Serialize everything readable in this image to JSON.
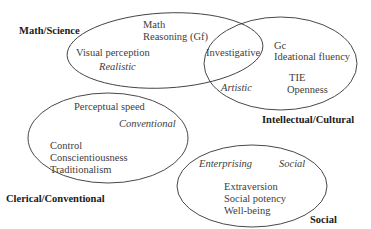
{
  "diagram": {
    "groups": [
      {
        "id": "math-science",
        "label": "Math/Science",
        "ellipse": {
          "cx": 165,
          "cy": 50.5,
          "rx": 98,
          "ry": 37.5
        },
        "items": [
          "Math",
          "Reasoning (Gf)",
          "Visual perception"
        ],
        "interest": "Realistic"
      },
      {
        "id": "intellectual-cultural",
        "label": "Intellectual/Cultural",
        "ellipse": {
          "cx": 280.5,
          "cy": 63.5,
          "rx": 76.5,
          "ry": 46.5
        },
        "items": [
          "Gc",
          "Ideational fluency",
          "TIE",
          "Openness"
        ],
        "interest": "Artistic"
      },
      {
        "id": "clerical-conventional",
        "label": "Clerical/Conventional",
        "ellipse": {
          "cx": 108,
          "cy": 138,
          "rx": 80,
          "ry": 45
        },
        "items": [
          "Perceptual speed",
          "Control",
          "Conscientiousness",
          "Traditionalism"
        ],
        "interest": "Conventional"
      },
      {
        "id": "social",
        "label": "Social",
        "ellipse": {
          "cx": 252,
          "cy": 186,
          "rx": 75,
          "ry": 41
        },
        "items": [
          "Extraversion",
          "Social potency",
          "Well-being"
        ],
        "interests": [
          "Enterprising",
          "Social"
        ]
      }
    ],
    "overlap": {
      "label": "Investigative",
      "between": [
        "math-science",
        "intellectual-cultural"
      ]
    },
    "stroke_color": "#333333"
  },
  "labels": {
    "math_science": "Math/Science",
    "intellectual_cultural": "Intellectual/Cultural",
    "clerical_conventional": "Clerical/Conventional",
    "social": "Social",
    "math": "Math",
    "reasoning": "Reasoning (Gf)",
    "visual_perception": "Visual perception",
    "realistic": "Realistic",
    "investigative": "Investigative",
    "gc": "Gc",
    "ideational_fluency": "Ideational fluency",
    "artistic": "Artistic",
    "tie": "TIE",
    "openness": "Openness",
    "perceptual_speed": "Perceptual speed",
    "conventional": "Conventional",
    "control": "Control",
    "conscientiousness": "Conscientiousness",
    "traditionalism": "Traditionalism",
    "enterprising": "Enterprising",
    "social_interest": "Social",
    "extraversion": "Extraversion",
    "social_potency": "Social potency",
    "well_being": "Well-being"
  }
}
